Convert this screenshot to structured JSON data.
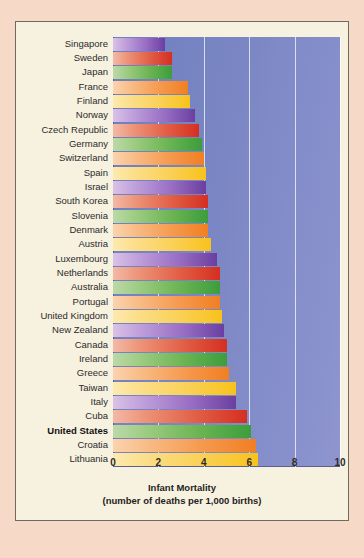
{
  "chart_data": {
    "type": "bar",
    "orientation": "horizontal",
    "title": "",
    "xlabel": "Infant Mortality",
    "xlabel_sub": "(number of deaths per 1,000 births)",
    "ylabel": "",
    "xlim": [
      0,
      10
    ],
    "xticks": [
      "0",
      "2",
      "4",
      "6",
      "8",
      "10"
    ],
    "grid": "vertical",
    "legend": "none",
    "highlight_category": "United States",
    "categories": [
      "Singapore",
      "Sweden",
      "Japan",
      "France",
      "Finland",
      "Norway",
      "Czech Republic",
      "Germany",
      "Switzerland",
      "Spain",
      "Israel",
      "South Korea",
      "Slovenia",
      "Denmark",
      "Austria",
      "Luxembourg",
      "Netherlands",
      "Australia",
      "Portugal",
      "United Kingdom",
      "New Zealand",
      "Canada",
      "Ireland",
      "Greece",
      "Taiwan",
      "Italy",
      "Cuba",
      "United States",
      "Croatia",
      "Lithuania"
    ],
    "values": [
      2.3,
      2.6,
      2.6,
      3.3,
      3.4,
      3.6,
      3.8,
      3.9,
      4.0,
      4.1,
      4.1,
      4.2,
      4.2,
      4.2,
      4.3,
      4.6,
      4.7,
      4.7,
      4.7,
      4.8,
      4.9,
      5.0,
      5.0,
      5.1,
      5.4,
      5.4,
      5.9,
      6.1,
      6.3,
      6.4
    ],
    "bar_palette": [
      "purple",
      "red",
      "green",
      "orange",
      "yellow"
    ]
  },
  "colors": {
    "page_background": "#f6d9c6",
    "card_background": "#f7f1e0",
    "plot_background": "#7b87c4",
    "gridline": "#ffffff",
    "label_text": "#2b2b2b",
    "purple": "#6b3fa0",
    "red": "#d52f22",
    "green": "#3c9d3c",
    "orange": "#f07f22",
    "yellow": "#f8c21c"
  }
}
